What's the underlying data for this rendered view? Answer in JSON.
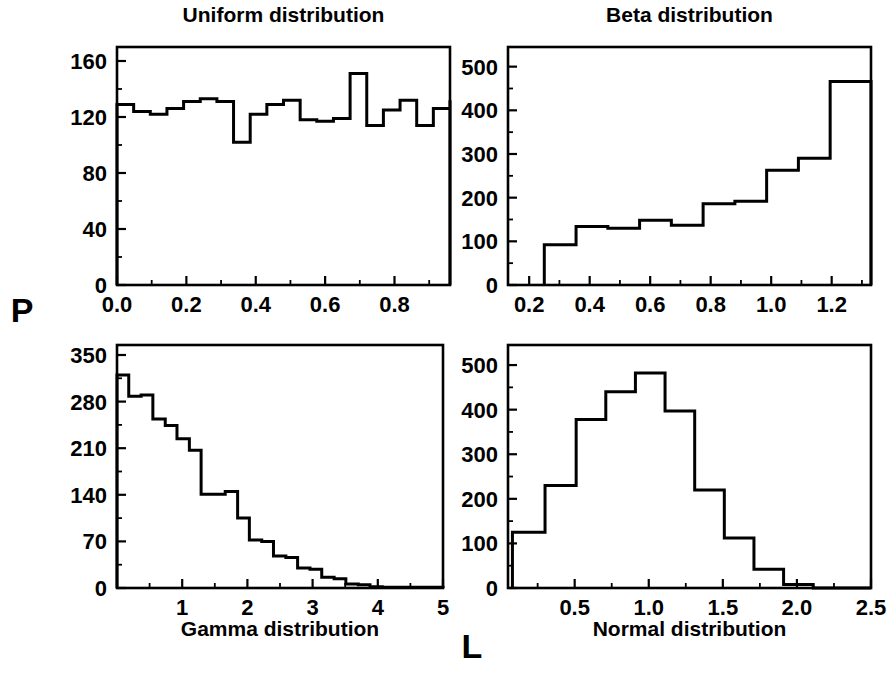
{
  "figure": {
    "width": 887,
    "height": 680,
    "background": "#ffffff",
    "line_color": "#000000",
    "shared_y_label": "P",
    "shared_x_label": "L"
  },
  "chart_data": [
    {
      "id": "uniform",
      "type": "bar",
      "title": "Uniform distribution",
      "xlabel": "",
      "ylabel": "P",
      "xlim": [
        0.0,
        0.96
      ],
      "ylim": [
        0,
        170
      ],
      "xticks": [
        0.0,
        0.2,
        0.4,
        0.6,
        0.8
      ],
      "xtick_labels": [
        "0.0",
        "0.2",
        "0.4",
        "0.6",
        "0.8"
      ],
      "yticks": [
        0,
        40,
        80,
        120,
        160
      ],
      "ytick_labels": [
        "0",
        "40",
        "80",
        "120",
        "160"
      ],
      "grid": false,
      "bin_edges": [
        0.0,
        0.048,
        0.096,
        0.144,
        0.192,
        0.24,
        0.288,
        0.336,
        0.384,
        0.432,
        0.48,
        0.528,
        0.576,
        0.624,
        0.672,
        0.72,
        0.768,
        0.816,
        0.864,
        0.912,
        0.96
      ],
      "values": [
        129,
        124,
        122,
        126,
        131,
        133,
        131,
        102,
        122,
        129,
        132,
        118,
        117,
        119,
        151,
        114,
        125,
        132,
        114,
        126,
        132,
        105
      ]
    },
    {
      "id": "beta",
      "type": "bar",
      "title": "Beta distribution",
      "xlabel": "",
      "ylabel": "P",
      "xlim": [
        0.13,
        1.33
      ],
      "ylim": [
        0,
        545
      ],
      "xticks": [
        0.2,
        0.4,
        0.6,
        0.8,
        1.0,
        1.2
      ],
      "xtick_labels": [
        "0.2",
        "0.4",
        "0.6",
        "0.8",
        "1.0",
        "1.2"
      ],
      "yticks": [
        0,
        100,
        200,
        300,
        400,
        500
      ],
      "ytick_labels": [
        "0",
        "100",
        "200",
        "300",
        "400",
        "500"
      ],
      "grid": false,
      "bin_edges": [
        0.25,
        0.355,
        0.46,
        0.565,
        0.67,
        0.775,
        0.88,
        0.985,
        1.09,
        1.195,
        1.33
      ],
      "values": [
        92,
        134,
        130,
        148,
        137,
        186,
        192,
        263,
        290,
        466,
        435
      ]
    },
    {
      "id": "gamma",
      "type": "bar",
      "title": "Gamma distribution",
      "xlabel": "Gamma distribution",
      "ylabel": "P",
      "xlim": [
        0.0,
        5.0
      ],
      "ylim": [
        0,
        365
      ],
      "xticks": [
        1,
        2,
        3,
        4,
        5
      ],
      "xtick_labels": [
        "1",
        "2",
        "3",
        "4",
        "5"
      ],
      "yticks": [
        0,
        70,
        140,
        210,
        280,
        350
      ],
      "ytick_labels": [
        "0",
        "70",
        "140",
        "210",
        "280",
        "350"
      ],
      "grid": false,
      "bin_edges": [
        0.0,
        0.18,
        0.37,
        0.55,
        0.74,
        0.92,
        1.11,
        1.29,
        1.48,
        1.66,
        1.85,
        2.03,
        2.22,
        2.4,
        2.59,
        2.77,
        2.96,
        3.14,
        3.33,
        3.51,
        3.7,
        3.88,
        4.07,
        5.0
      ],
      "values": [
        320,
        288,
        290,
        254,
        244,
        224,
        207,
        141,
        141,
        145,
        105,
        72,
        70,
        48,
        46,
        30,
        28,
        16,
        14,
        6,
        5,
        2,
        1,
        0
      ]
    },
    {
      "id": "normal",
      "type": "bar",
      "title": "Normal distribution",
      "xlabel": "Normal distribution",
      "ylabel": "P",
      "xlim": [
        0.05,
        2.5
      ],
      "ylim": [
        0,
        545
      ],
      "xticks": [
        0.5,
        1.0,
        1.5,
        2.0,
        2.5
      ],
      "xtick_labels": [
        "0.5",
        "1.0",
        "1.5",
        "2.0",
        "2.5"
      ],
      "yticks": [
        0,
        100,
        200,
        300,
        400,
        500
      ],
      "ytick_labels": [
        "0",
        "100",
        "200",
        "300",
        "400",
        "500"
      ],
      "grid": false,
      "bin_edges": [
        0.08,
        0.3,
        0.51,
        0.71,
        0.91,
        1.11,
        1.31,
        1.51,
        1.71,
        1.91,
        2.11,
        2.5
      ],
      "values": [
        125,
        230,
        378,
        440,
        482,
        397,
        220,
        112,
        42,
        8,
        0
      ]
    }
  ]
}
